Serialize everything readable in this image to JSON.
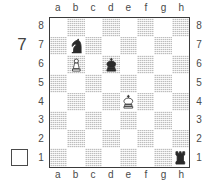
{
  "diagram": {
    "move_number": "7",
    "side_to_move_indicator": "white-empty-square",
    "side_to_move": "white"
  },
  "coordinates": {
    "files": [
      "a",
      "b",
      "c",
      "d",
      "e",
      "f",
      "g",
      "h"
    ],
    "ranks": [
      "8",
      "7",
      "6",
      "5",
      "4",
      "3",
      "2",
      "1"
    ]
  },
  "colors": {
    "light_square": "#ffffff",
    "dark_square": "#bdbdbd",
    "border": "#3a3a3a",
    "text": "#4a4a4a",
    "white_piece_fill": "#ffffff",
    "black_piece_fill": "#2b2b2b"
  },
  "chart_data": {
    "type": "table",
    "xlabel": "file",
    "ylabel": "rank",
    "categories": [
      "a",
      "b",
      "c",
      "d",
      "e",
      "f",
      "g",
      "h"
    ],
    "orientation": "white-bottom",
    "move_number": 7,
    "side_to_move": "white",
    "pieces": [
      {
        "square": "b7",
        "file": "b",
        "rank": 7,
        "color": "black",
        "type": "knight",
        "glyph": "♞"
      },
      {
        "square": "b6",
        "file": "b",
        "rank": 6,
        "color": "white",
        "type": "pawn",
        "glyph": "♙"
      },
      {
        "square": "d6",
        "file": "d",
        "rank": 6,
        "color": "black",
        "type": "king",
        "glyph": "♚"
      },
      {
        "square": "e4",
        "file": "e",
        "rank": 4,
        "color": "white",
        "type": "king",
        "glyph": "♔"
      },
      {
        "square": "h1",
        "file": "h",
        "rank": 1,
        "color": "black",
        "type": "rook",
        "glyph": "♜"
      }
    ],
    "board": [
      [
        "",
        "n",
        "",
        "",
        "",
        "",
        "",
        ""
      ],
      [
        "",
        "P",
        "",
        "k",
        "",
        "",
        "",
        ""
      ],
      [
        "",
        "",
        "",
        "",
        "",
        "",
        "",
        ""
      ],
      [
        "",
        "",
        "",
        "",
        "K",
        "",
        "",
        ""
      ],
      [
        "",
        "",
        "",
        "",
        "",
        "",
        "",
        ""
      ],
      [
        "",
        "",
        "",
        "",
        "",
        "",
        "",
        ""
      ],
      [
        "",
        "",
        "",
        "",
        "",
        "",
        "",
        ""
      ],
      [
        "",
        "",
        "",
        "",
        "",
        "",
        "",
        "r"
      ]
    ],
    "board_ranks": [
      8,
      7,
      6,
      5,
      4,
      3,
      2,
      1
    ]
  }
}
